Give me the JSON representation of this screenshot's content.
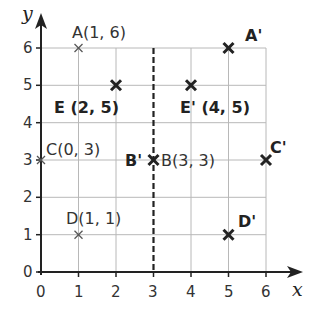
{
  "axes": {
    "x_label": "x",
    "y_label": "y",
    "x_ticks": [
      "0",
      "1",
      "2",
      "3",
      "4",
      "5",
      "6"
    ],
    "y_ticks": [
      "0",
      "1",
      "2",
      "3",
      "4",
      "5",
      "6"
    ]
  },
  "mirror_line": {
    "x": 3,
    "style": "dashed"
  },
  "points": {
    "original": [
      {
        "name": "A",
        "x": 1,
        "y": 6,
        "label": "A(1, 6)"
      },
      {
        "name": "B",
        "x": 3,
        "y": 3,
        "label": "B(3, 3)"
      },
      {
        "name": "C",
        "x": 0,
        "y": 3,
        "label": "C(0, 3)"
      },
      {
        "name": "D",
        "x": 1,
        "y": 1,
        "label": "D(1, 1)"
      },
      {
        "name": "E",
        "x": 2,
        "y": 5,
        "label": "E (2, 5)"
      }
    ],
    "image": [
      {
        "name": "A'",
        "x": 5,
        "y": 6,
        "label": "A'"
      },
      {
        "name": "B'",
        "x": 3,
        "y": 3,
        "label": "B'"
      },
      {
        "name": "C'",
        "x": 6,
        "y": 3,
        "label": "C'"
      },
      {
        "name": "D'",
        "x": 5,
        "y": 1,
        "label": "D'"
      },
      {
        "name": "E'",
        "x": 4,
        "y": 5,
        "label": "E' (4, 5)"
      }
    ]
  }
}
